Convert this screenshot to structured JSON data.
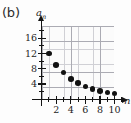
{
  "figure": {
    "panel_label": "(b)",
    "background": "#fdfdfd",
    "point_color": "#111111",
    "grid_color": "#c9c9cf",
    "axis_color": "#141414"
  },
  "chart_data": {
    "type": "scatter",
    "title": "",
    "subtitle": "",
    "xlabel": "n",
    "ylabel": "a_n",
    "ylabel_display": "a",
    "ylabel_subscript": "n",
    "grid": true,
    "legend": null,
    "xlim": [
      0,
      11
    ],
    "ylim": [
      0,
      18
    ],
    "x_major_ticks": [
      2,
      4,
      6,
      8,
      10
    ],
    "x_major_tick_labels": [
      "2",
      "4",
      "6",
      "8",
      "10"
    ],
    "x_minor_ticks": [
      1,
      3,
      5,
      7,
      9,
      11
    ],
    "y_major_ticks": [
      4,
      8,
      12,
      16
    ],
    "y_major_tick_labels": [
      "4",
      "8",
      "12",
      "16"
    ],
    "y_minor_ticks": [
      2,
      6,
      10,
      14,
      18
    ],
    "x": [
      1,
      2,
      3,
      4,
      5,
      6,
      7,
      8,
      9,
      10
    ],
    "values": [
      12,
      9,
      7,
      5.3,
      4.3,
      3.4,
      2.7,
      2.2,
      1.8,
      1.5
    ],
    "points": [
      {
        "n": 1,
        "a": 12
      },
      {
        "n": 2,
        "a": 9
      },
      {
        "n": 3,
        "a": 7
      },
      {
        "n": 4,
        "a": 5.3
      },
      {
        "n": 5,
        "a": 4.3
      },
      {
        "n": 6,
        "a": 3.4
      },
      {
        "n": 7,
        "a": 2.7
      },
      {
        "n": 8,
        "a": 2.2
      },
      {
        "n": 9,
        "a": 1.8
      },
      {
        "n": 10,
        "a": 1.5
      }
    ],
    "annotations": []
  }
}
